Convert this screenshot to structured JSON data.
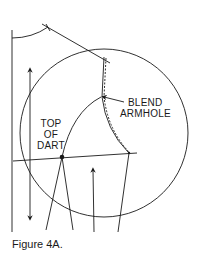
{
  "figure": {
    "caption": "Figure 4A.",
    "labels": {
      "blend_line1": "BLEND",
      "blend_line2": "ARMHOLE",
      "top_line1": "TOP",
      "top_line2": "OF",
      "top_line3": "DART"
    },
    "colors": {
      "ink": "#1a1a1a",
      "background": "#ffffff"
    }
  }
}
